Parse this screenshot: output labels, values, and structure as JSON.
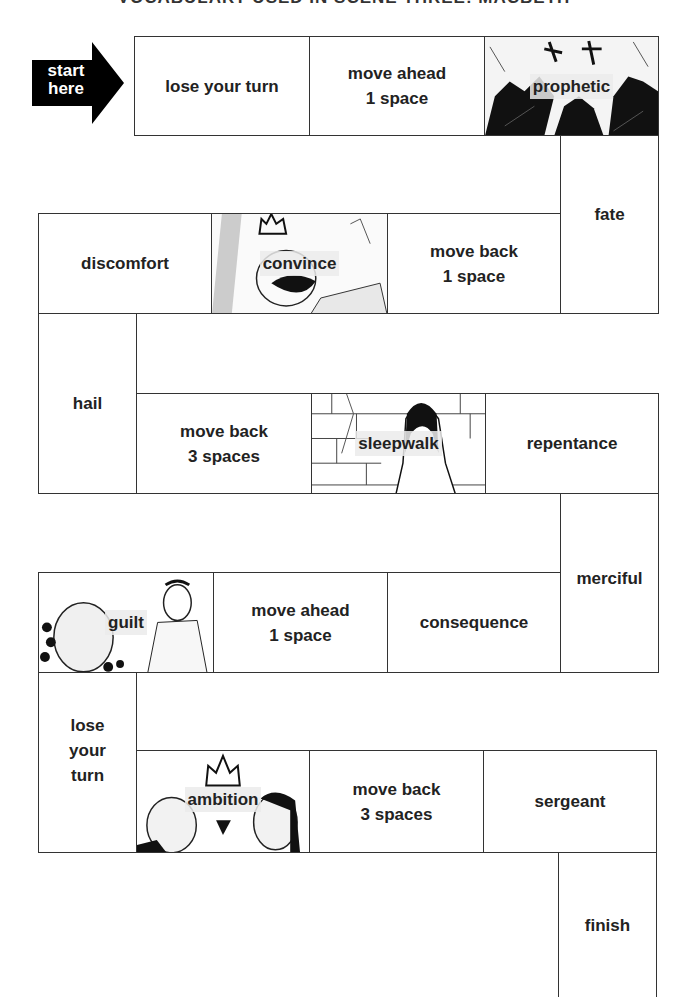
{
  "title": "VOCABULARY USED IN SCENE THREE: MACBETH",
  "start": {
    "line1": "start",
    "line2": "here"
  },
  "squares": [
    {
      "id": 1,
      "label": "lose your turn",
      "type": "action"
    },
    {
      "id": 2,
      "label": "move ahead\n1 space",
      "type": "action"
    },
    {
      "id": 3,
      "label": "prophetic",
      "type": "word",
      "illustrated": true
    },
    {
      "id": 4,
      "label": "fate",
      "type": "word"
    },
    {
      "id": 5,
      "label": "move back\n1 space",
      "type": "action"
    },
    {
      "id": 6,
      "label": "convince",
      "type": "word",
      "illustrated": true
    },
    {
      "id": 7,
      "label": "discomfort",
      "type": "word"
    },
    {
      "id": 8,
      "label": "hail",
      "type": "word"
    },
    {
      "id": 9,
      "label": "move back\n3 spaces",
      "type": "action"
    },
    {
      "id": 10,
      "label": "sleepwalk",
      "type": "word",
      "illustrated": true
    },
    {
      "id": 11,
      "label": "repentance",
      "type": "word"
    },
    {
      "id": 12,
      "label": "merciful",
      "type": "word"
    },
    {
      "id": 13,
      "label": "consequence",
      "type": "word"
    },
    {
      "id": 14,
      "label": "move ahead\n1 space",
      "type": "action"
    },
    {
      "id": 15,
      "label": "guilt",
      "type": "word",
      "illustrated": true
    },
    {
      "id": 16,
      "label": "lose\nyour\nturn",
      "type": "action"
    },
    {
      "id": 17,
      "label": "ambition",
      "type": "word",
      "illustrated": true
    },
    {
      "id": 18,
      "label": "move back\n3 spaces",
      "type": "action"
    },
    {
      "id": 19,
      "label": "sergeant",
      "type": "word"
    },
    {
      "id": 20,
      "label": "finish",
      "type": "end"
    }
  ]
}
